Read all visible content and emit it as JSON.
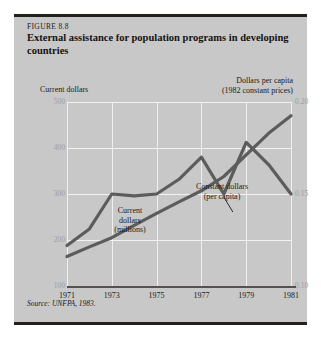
{
  "figure": {
    "number_label": "FIGURE 8.8",
    "title": "External assistance for population programs in developing countries",
    "source": "Source: UNFPA, 1983.",
    "left_axis_header": "Current dollars",
    "right_axis_header_line1": "Dollars per capita",
    "right_axis_header_line2": "(1982 constant prices)"
  },
  "annotations": {
    "current_dollars_line1": "Current",
    "current_dollars_line2": "dollars",
    "current_dollars_line3": "(millions)",
    "constant_dollars_line1": "Constant dollars",
    "constant_dollars_line2": "(per capita)"
  },
  "chart_data": {
    "type": "line",
    "title": "External assistance for population programs in developing countries",
    "xlabel": "",
    "ylabel": "Current dollars",
    "ylabel_right": "Dollars per capita (1982 constant prices)",
    "grid": true,
    "legend": "inline-annotations",
    "x": [
      1971,
      1972,
      1973,
      1974,
      1975,
      1976,
      1977,
      1978,
      1979,
      1980,
      1981
    ],
    "xticks": [
      "1971",
      "1973",
      "1975",
      "1977",
      "1979",
      "1981"
    ],
    "xlim": [
      1971,
      1981
    ],
    "ylim_left": [
      100,
      500
    ],
    "yticks_left": [
      "100",
      "200",
      "300",
      "400",
      "500"
    ],
    "ylim_right": [
      0.1,
      0.2
    ],
    "yticks_right": [
      "0.10",
      "0.15",
      "0.20"
    ],
    "series": [
      {
        "name": "Current dollars (millions)",
        "axis": "left",
        "color": "#5c5c5c",
        "values": [
          164,
          185,
          205,
          232,
          258,
          283,
          307,
          338,
          385,
          432,
          470
        ]
      },
      {
        "name": "Constant dollars (per capita)",
        "axis": "right",
        "color": "#5c5c5c",
        "values": [
          0.122,
          0.131,
          0.15,
          0.149,
          0.15,
          0.158,
          0.17,
          0.15,
          0.178,
          0.166,
          0.15
        ]
      }
    ]
  }
}
